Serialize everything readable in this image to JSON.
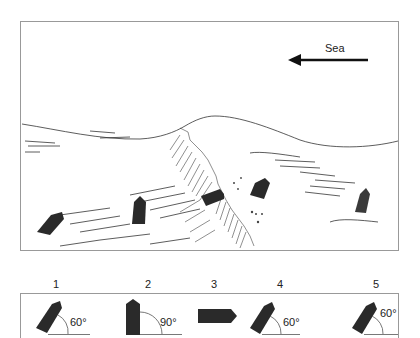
{
  "scene": {
    "direction_label": "Sea",
    "direction": "right-to-left",
    "boats": [
      {
        "id": 1,
        "color": "#2a2a2a"
      },
      {
        "id": 2,
        "color": "#2a2a2a"
      },
      {
        "id": 3,
        "color": "#2a2a2a"
      },
      {
        "id": 4,
        "color": "#2a2a2a"
      },
      {
        "id": 5,
        "color": "#3a3a3a"
      }
    ]
  },
  "legend": {
    "items": [
      {
        "number": "1",
        "angle": "60°"
      },
      {
        "number": "2",
        "angle": "90°"
      },
      {
        "number": "3",
        "angle": ""
      },
      {
        "number": "4",
        "angle": "60°"
      },
      {
        "number": "5",
        "angle": "60°"
      }
    ]
  }
}
